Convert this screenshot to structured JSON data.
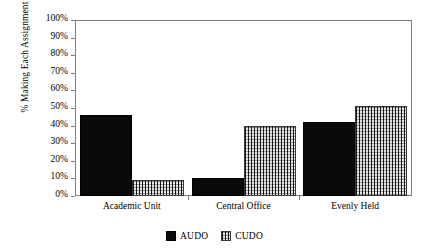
{
  "chart_data": {
    "type": "bar",
    "title": "",
    "subtitle": "",
    "xlabel": "",
    "ylabel": "% Making Each Assignment",
    "categories": [
      "Academic Unit",
      "Central Office",
      "Evenly Held"
    ],
    "series": [
      {
        "name": "AUDO",
        "values": [
          46,
          10,
          42
        ],
        "pattern": "solid-black",
        "color": "#0a0a0a"
      },
      {
        "name": "CUDO",
        "values": [
          9,
          40,
          51
        ],
        "pattern": "crosshatch-gray",
        "color": "#8e8e8e"
      }
    ],
    "ylim": [
      0,
      100
    ],
    "ytick_labels": [
      "0%",
      "10%",
      "20%",
      "30%",
      "40%",
      "50%",
      "60%",
      "70%",
      "80%",
      "90%",
      "100%"
    ],
    "ytick_values": [
      0,
      10,
      20,
      30,
      40,
      50,
      60,
      70,
      80,
      90,
      100
    ],
    "grid": false,
    "legend_position": "bottom-center",
    "legend_entries": [
      "AUDO",
      "CUDO"
    ],
    "annotations": []
  },
  "axis": {
    "y_title": "% Making Each Assignment"
  }
}
